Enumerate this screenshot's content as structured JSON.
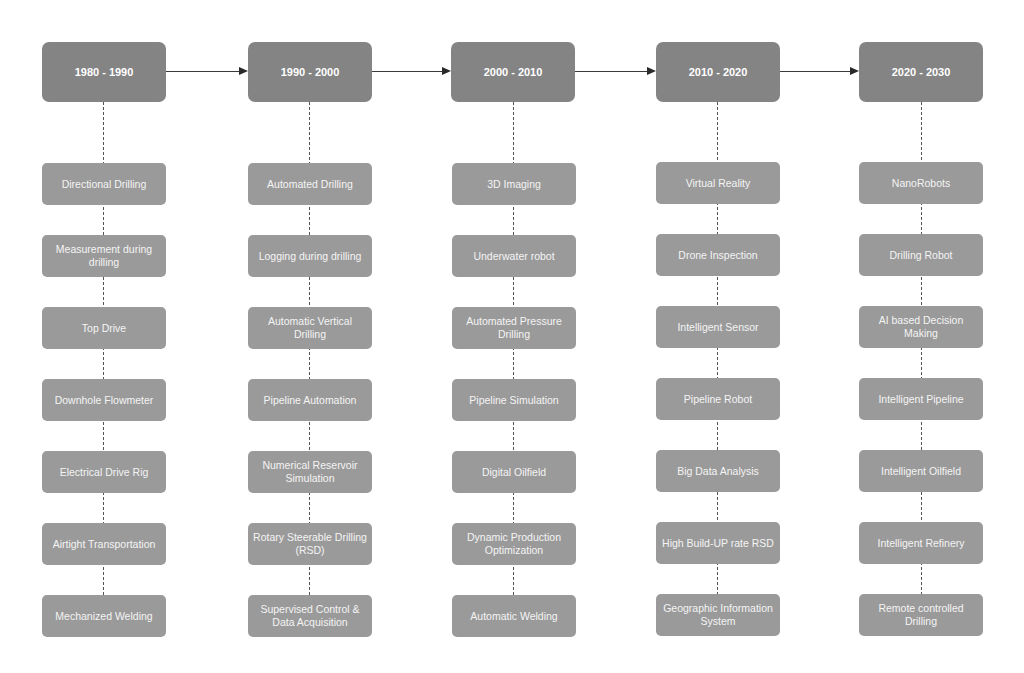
{
  "diagram": {
    "type": "timeline-flowchart",
    "colors": {
      "header_box": "#848484",
      "item_box": "#9a9a9a",
      "text": "#ffffff",
      "connector": "#3a3a3a"
    },
    "periods": [
      {
        "label": "1980 - 1990",
        "items": [
          "Directional Drilling",
          "Measurement during drilling",
          "Top Drive",
          "Downhole Flowmeter",
          "Electrical Drive Rig",
          "Airtight Transportation",
          "Mechanized Welding"
        ]
      },
      {
        "label": "1990 - 2000",
        "items": [
          "Automated Drilling",
          "Logging during drilling",
          "Automatic Vertical Drilling",
          "Pipeline Automation",
          "Numerical Reservoir Simulation",
          "Rotary Steerable Drilling (RSD)",
          "Supervised Control & Data Acquisition"
        ]
      },
      {
        "label": "2000 - 2010",
        "items": [
          "3D Imaging",
          "Underwater robot",
          "Automated Pressure Drilling",
          "Pipeline Simulation",
          "Digital Oilfield",
          "Dynamic Production Optimization",
          "Automatic Welding"
        ]
      },
      {
        "label": "2010 - 2020",
        "items": [
          "Virtual Reality",
          "Drone Inspection",
          "Intelligent Sensor",
          "Pipeline Robot",
          "Big Data Analysis",
          "High Build-UP rate RSD",
          "Geographic Information System"
        ]
      },
      {
        "label": "2020 - 2030",
        "items": [
          "NanoRobots",
          "Drilling Robot",
          "AI based Decision Making",
          "Intelligent Pipeline",
          "Intelligent Oilfield",
          "Intelligent Refinery",
          "Remote controlled Drilling"
        ]
      }
    ]
  }
}
